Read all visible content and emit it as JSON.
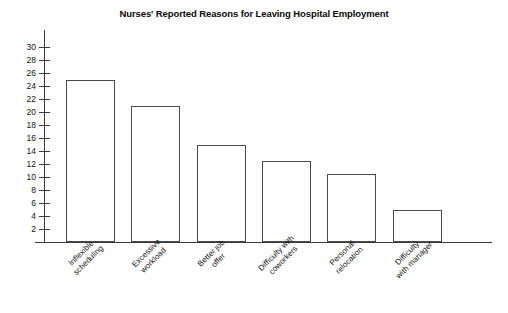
{
  "chart_data": {
    "type": "bar",
    "title": "Nurses' Reported Reasons for Leaving Hospital Employment",
    "xlabel": "",
    "ylabel": "",
    "categories": [
      "Inflexible scheduling",
      "Excessive workload",
      "Better job offer",
      "Difficulty with coworkers",
      "Personal relocation",
      "Difficulty with manager"
    ],
    "category_lines": [
      [
        "Inflexible",
        "scheduling"
      ],
      [
        "Excessive",
        "workload"
      ],
      [
        "Better job",
        "offer"
      ],
      [
        "Difficulty with",
        "coworkers"
      ],
      [
        "Personal",
        "relocation"
      ],
      [
        "Difficulty",
        "with manager"
      ]
    ],
    "values": [
      25,
      21,
      15,
      12.5,
      10.5,
      5
    ],
    "ylim": [
      0,
      31
    ],
    "yticks": [
      2,
      4,
      6,
      8,
      10,
      12,
      14,
      16,
      18,
      20,
      22,
      24,
      26,
      28,
      30
    ],
    "ytick_labels": [
      "2",
      "4",
      "6",
      "8",
      "10",
      "12",
      "14",
      "16",
      "18",
      "20",
      "22",
      "24",
      "26",
      "28",
      "30"
    ],
    "grid": false,
    "legend": false,
    "bar_fill_color": "#ffffff",
    "bar_edge_color": "#4a4a4a",
    "axis_color": "#3b3b3b",
    "text_color": "#121212",
    "background_color": "#ffffff"
  }
}
